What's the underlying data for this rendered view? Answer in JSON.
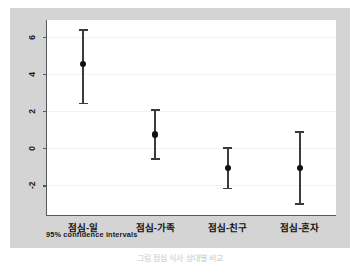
{
  "figure": {
    "footnote": "95% confidence intervals",
    "caption": "그림  점심 식사 상대별 비교",
    "frame_color": "#d4d4d4",
    "plot_background": "#ffffff",
    "axis_color": "#55595c",
    "marker_color": "#111111",
    "whisker_color": "#3b3b3b"
  },
  "chart_data": {
    "type": "scatter",
    "title": "",
    "subtitle": "",
    "xlabel": "",
    "ylabel": "",
    "annotation": "95% confidence intervals",
    "grid": true,
    "legend": "none",
    "ylim": [
      -3.6,
      6.9
    ],
    "yticks": [
      6,
      4,
      2,
      0,
      -2
    ],
    "ytick_labels": [
      "6",
      "4",
      "2",
      "0",
      "-2"
    ],
    "categories": [
      "점심-일",
      "점심-가족",
      "점심-친구",
      "점심-혼자"
    ],
    "series": [
      {
        "name": "mean",
        "values": [
          4.55,
          0.73,
          -1.05,
          -1.05
        ]
      },
      {
        "name": "ci_upper",
        "values": [
          6.4,
          2.1,
          0.05,
          0.92
        ]
      },
      {
        "name": "ci_lower",
        "values": [
          2.45,
          -0.55,
          -2.14,
          -2.96
        ]
      }
    ]
  }
}
